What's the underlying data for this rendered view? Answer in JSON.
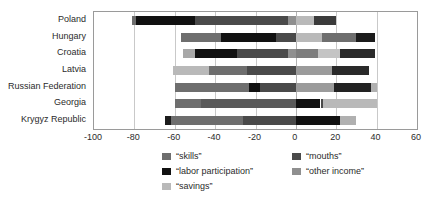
{
  "chart_data": {
    "type": "bar",
    "orientation": "horizontal",
    "stacked": true,
    "title": "",
    "xlabel": "",
    "ylabel": "",
    "xlim": [
      -100,
      60
    ],
    "xticks": [
      -100,
      -80,
      -60,
      -40,
      -20,
      0,
      20,
      40,
      60
    ],
    "xtick_labels": [
      "-100",
      "-80",
      "-60",
      "-40",
      "-20",
      "0",
      "20",
      "40",
      "60"
    ],
    "grid": true,
    "grid_axis": "x",
    "legend_position": "bottom",
    "categories": [
      "Poland",
      "Hungary",
      "Croatia",
      "Latvia",
      "Russian Federation",
      "Georgia",
      "Krygyz Republic"
    ],
    "series": [
      {
        "name": "“skills”",
        "color": "#6e6e6e",
        "values": [
          -2.0,
          -20.0,
          -3.0,
          -18.0,
          -37.0,
          -13.0,
          -38.0
        ]
      },
      {
        "name": "“labor participation”",
        "color": "#111111",
        "values": [
          -29.0,
          -27.0,
          -21.0,
          0.0,
          -5.0,
          12.0,
          22.0
        ]
      },
      {
        "name": "“mouths”",
        "color": "#4a4a4a",
        "values": [
          -46.0,
          -9.0,
          -25.0,
          -24.0,
          -18.0,
          -19.0,
          -25.0
        ]
      },
      {
        "name": "“other income”",
        "color": "#8f8f8f",
        "values": [
          -4.0,
          26.0,
          11.0,
          36.0,
          37.0,
          1.0,
          0.0
        ]
      },
      {
        "name": "“savings”",
        "color": "#b9b9b9",
        "values": [
          20.0,
          13.0,
          28.0,
          0.0,
          4.0,
          27.0,
          8.0
        ]
      }
    ],
    "bars": [
      {
        "category": "Poland",
        "negative_total": -81.0,
        "positive_total": 20.0,
        "segments": [
          {
            "series": "“skills”",
            "start": -81.0,
            "end": -79.0,
            "value": 2.0,
            "color": "#6e6e6e"
          },
          {
            "series": "“labor participation”",
            "start": -79.0,
            "end": -50.0,
            "value": 29.0,
            "color": "#111111"
          },
          {
            "series": "“mouths”",
            "start": -50.0,
            "end": -4.0,
            "value": 46.0,
            "color": "#4a4a4a"
          },
          {
            "series": "“other income”",
            "start": -4.0,
            "end": 0.0,
            "value": 4.0,
            "color": "#8f8f8f"
          },
          {
            "series": "“savings”",
            "start": 0.0,
            "end": 9.0,
            "value": 9.0,
            "color": "#b9b9b9"
          },
          {
            "series": "“mouths”",
            "start": 9.0,
            "end": 20.0,
            "value": 11.0,
            "color": "#3b3b3b"
          }
        ]
      },
      {
        "category": "Hungary",
        "negative_total": -57.0,
        "positive_total": 39.0,
        "segments": [
          {
            "series": "“skills”",
            "start": -57.0,
            "end": -37.0,
            "value": 20.0,
            "color": "#6e6e6e"
          },
          {
            "series": "“labor participation”",
            "start": -37.0,
            "end": -10.0,
            "value": 27.0,
            "color": "#111111"
          },
          {
            "series": "“mouths”",
            "start": -10.0,
            "end": 0.0,
            "value": 10.0,
            "color": "#4a4a4a"
          },
          {
            "series": "“savings”",
            "start": 0.0,
            "end": 13.0,
            "value": 13.0,
            "color": "#b9b9b9"
          },
          {
            "series": "“other income”",
            "start": 13.0,
            "end": 30.0,
            "value": 17.0,
            "color": "#6e6e6e"
          },
          {
            "series": "“mouths”",
            "start": 30.0,
            "end": 39.0,
            "value": 9.0,
            "color": "#1c1c1c"
          }
        ]
      },
      {
        "category": "Croatia",
        "negative_total": -56.0,
        "positive_total": 39.0,
        "segments": [
          {
            "series": "“savings”",
            "start": -56.0,
            "end": -50.0,
            "value": 6.0,
            "color": "#a8a8a8"
          },
          {
            "series": "“labor participation”",
            "start": -50.0,
            "end": -29.0,
            "value": 21.0,
            "color": "#111111"
          },
          {
            "series": "“mouths”",
            "start": -29.0,
            "end": -4.0,
            "value": 25.0,
            "color": "#4a4a4a"
          },
          {
            "series": "“other income”",
            "start": -4.0,
            "end": 0.0,
            "value": 4.0,
            "color": "#8f8f8f"
          },
          {
            "series": "“other income”",
            "start": 0.0,
            "end": 11.0,
            "value": 11.0,
            "color": "#7d7d7d"
          },
          {
            "series": "“savings”",
            "start": 11.0,
            "end": 22.0,
            "value": 11.0,
            "color": "#c4c4c4"
          },
          {
            "series": "“mouths”",
            "start": 22.0,
            "end": 39.0,
            "value": 17.0,
            "color": "#2a2a2a"
          }
        ]
      },
      {
        "category": "Latvia",
        "negative_total": -61.0,
        "positive_total": 36.0,
        "segments": [
          {
            "series": "“savings”",
            "start": -61.0,
            "end": -43.0,
            "value": 18.0,
            "color": "#b9b9b9"
          },
          {
            "series": "“skills”",
            "start": -43.0,
            "end": -24.0,
            "value": 19.0,
            "color": "#6e6e6e"
          },
          {
            "series": "“mouths”",
            "start": -24.0,
            "end": 0.0,
            "value": 24.0,
            "color": "#4a4a4a"
          },
          {
            "series": "“other income”",
            "start": 0.0,
            "end": 18.0,
            "value": 18.0,
            "color": "#9b9b9b"
          },
          {
            "series": "“mouths”",
            "start": 18.0,
            "end": 36.0,
            "value": 18.0,
            "color": "#2a2a2a"
          }
        ]
      },
      {
        "category": "Russian Federation",
        "negative_total": -60.0,
        "positive_total": 40.0,
        "segments": [
          {
            "series": "“skills”",
            "start": -60.0,
            "end": -23.0,
            "value": 37.0,
            "color": "#6e6e6e"
          },
          {
            "series": "“labor participation”",
            "start": -23.0,
            "end": -18.0,
            "value": 5.0,
            "color": "#111111"
          },
          {
            "series": "“mouths”",
            "start": -18.0,
            "end": 0.0,
            "value": 18.0,
            "color": "#4a4a4a"
          },
          {
            "series": "“other income”",
            "start": 0.0,
            "end": 19.0,
            "value": 19.0,
            "color": "#9b9b9b"
          },
          {
            "series": "“mouths”",
            "start": 19.0,
            "end": 37.0,
            "value": 18.0,
            "color": "#222222"
          },
          {
            "series": "“savings”",
            "start": 37.0,
            "end": 40.0,
            "value": 3.0,
            "color": "#b0b0b0"
          }
        ]
      },
      {
        "category": "Georgia",
        "negative_total": -60.0,
        "positive_total": 40.0,
        "segments": [
          {
            "series": "“skills”",
            "start": -60.0,
            "end": -47.0,
            "value": 13.0,
            "color": "#6e6e6e"
          },
          {
            "series": "“mouths”",
            "start": -47.0,
            "end": 0.0,
            "value": 47.0,
            "color": "#5a5a5a"
          },
          {
            "series": "“labor participation”",
            "start": 0.0,
            "end": 12.0,
            "value": 12.0,
            "color": "#111111"
          },
          {
            "series": "“mouths”",
            "start": 12.5,
            "end": 13.5,
            "value": 1.0,
            "color": "#4a4a4a"
          },
          {
            "series": "“savings”",
            "start": 13.5,
            "end": 40.0,
            "value": 26.5,
            "color": "#b9b9b9"
          }
        ]
      },
      {
        "category": "Krygyz Republic",
        "negative_total": -65.0,
        "positive_total": 30.0,
        "segments": [
          {
            "series": "“labor participation”",
            "start": -65.0,
            "end": -62.0,
            "value": 3.0,
            "color": "#1c1c1c"
          },
          {
            "series": "“skills”",
            "start": -62.0,
            "end": -26.0,
            "value": 36.0,
            "color": "#6e6e6e"
          },
          {
            "series": "“mouths”",
            "start": -26.0,
            "end": 0.0,
            "value": 26.0,
            "color": "#4a4a4a"
          },
          {
            "series": "“labor participation”",
            "start": 0.0,
            "end": 22.0,
            "value": 22.0,
            "color": "#111111"
          },
          {
            "series": "“savings”",
            "start": 22.0,
            "end": 30.0,
            "value": 8.0,
            "color": "#b0b0b0"
          }
        ]
      }
    ],
    "legend": [
      {
        "label": "“skills”",
        "color": "#6e6e6e",
        "column": 0,
        "row": 0
      },
      {
        "label": "“labor participation”",
        "color": "#111111",
        "column": 0,
        "row": 1
      },
      {
        "label": "“savings”",
        "color": "#b9b9b9",
        "column": 0,
        "row": 2
      },
      {
        "label": "“mouths”",
        "color": "#4a4a4a",
        "column": 1,
        "row": 0
      },
      {
        "label": "“other income”",
        "color": "#8f8f8f",
        "column": 1,
        "row": 1
      }
    ]
  }
}
